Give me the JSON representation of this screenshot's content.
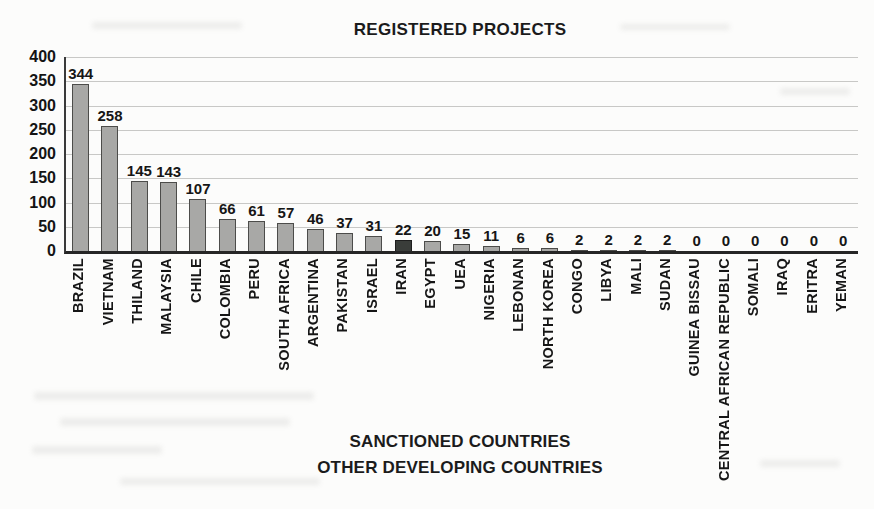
{
  "chart_data": {
    "type": "bar",
    "title": "REGISTERED PROJECTS",
    "xlabel_line1": "SANCTIONED COUNTRIES",
    "xlabel_line2": "OTHER DEVELOPING COUNTRIES",
    "ylabel": "",
    "ylim": [
      0,
      400
    ],
    "y_ticks": [
      400,
      350,
      300,
      250,
      200,
      150,
      100,
      50,
      0
    ],
    "grid": true,
    "legend_position": "none",
    "categories": [
      "BRAZIL",
      "VIETNAM",
      "THILAND",
      "MALAYSIA",
      "CHILE",
      "COLOMBIA",
      "PERU",
      "SOUTH AFRICA",
      "ARGENTINA",
      "PAKISTAN",
      "ISRAEL",
      "IRAN",
      "EGYPT",
      "UEA",
      "NIGERIA",
      "LEBONAN",
      "NORTH KOREA",
      "CONGO",
      "LIBYA",
      "MALI",
      "SUDAN",
      "GUINEA BISSAU",
      "CENTRAL AFRICAN REPUBLIC",
      "SOMALI",
      "IRAQ",
      "ERITRA",
      "YEMAN"
    ],
    "values": [
      344,
      258,
      145,
      143,
      107,
      66,
      61,
      57,
      46,
      37,
      31,
      22,
      20,
      15,
      11,
      6,
      6,
      2,
      2,
      2,
      2,
      0,
      0,
      0,
      0,
      0,
      0
    ],
    "data_labels_shown": true,
    "colors": {
      "bar_fill": "#a8a8a6",
      "bar_border": "#4c4c4a",
      "highlight_fill": "#3a3d3a",
      "highlight_border": "#1e1e1e",
      "gridline": "#c8c8c6",
      "axis_line": "#2a2a2a",
      "text": "#1b1b1b"
    },
    "highlight_index": 11,
    "highlight_category": "IRAN"
  }
}
